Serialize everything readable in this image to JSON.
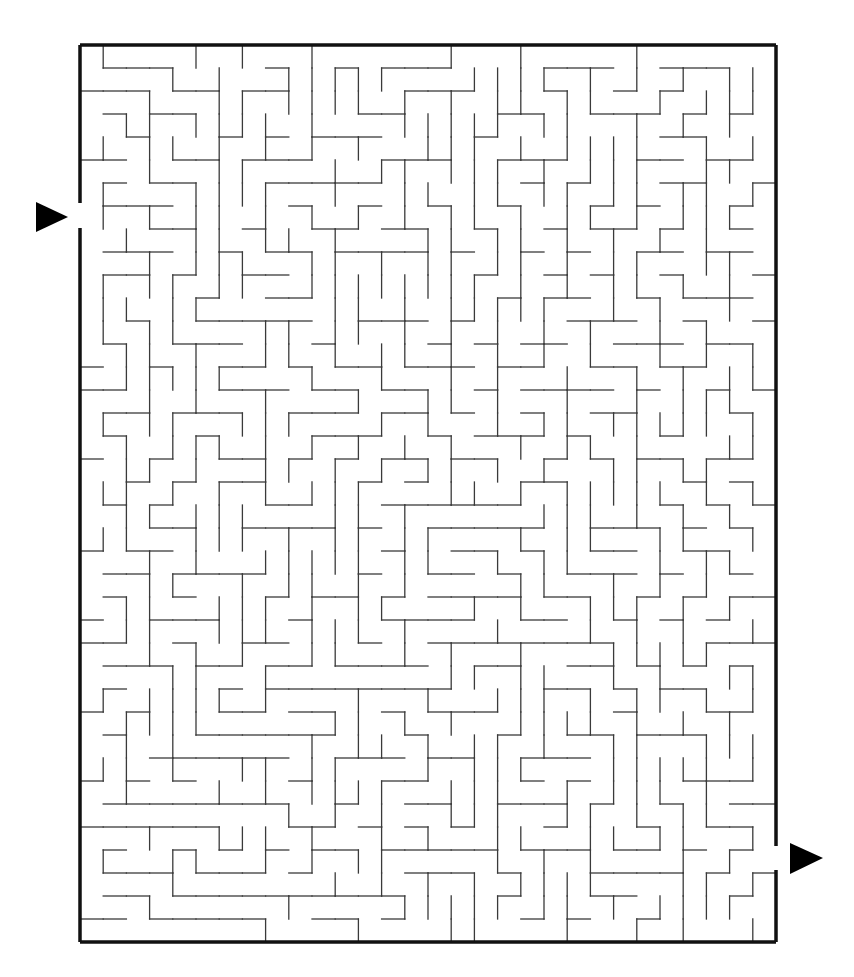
{
  "puzzle": {
    "type": "maze",
    "grid": {
      "cols": 30,
      "rows": 39,
      "cell": 23.1,
      "left": 80,
      "top": 45
    },
    "colors": {
      "wall": "#3a3a3a",
      "border": "#111111",
      "arrow": "#000000",
      "background": "#ffffff"
    },
    "entrance": {
      "side": "left",
      "y": 215,
      "label": "start-arrow"
    },
    "exit": {
      "side": "right",
      "y": 858,
      "label": "finish-arrow"
    }
  }
}
